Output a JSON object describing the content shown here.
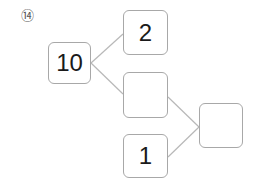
{
  "problem": {
    "number_label": "⑭"
  },
  "diagram": {
    "boxes": {
      "root": {
        "value": "10"
      },
      "top_right": {
        "value": "2"
      },
      "middle": {
        "value": ""
      },
      "bottom": {
        "value": "1"
      },
      "result": {
        "value": ""
      }
    },
    "line_color": "#b0b0b0",
    "border_color": "#a8a8a8"
  }
}
